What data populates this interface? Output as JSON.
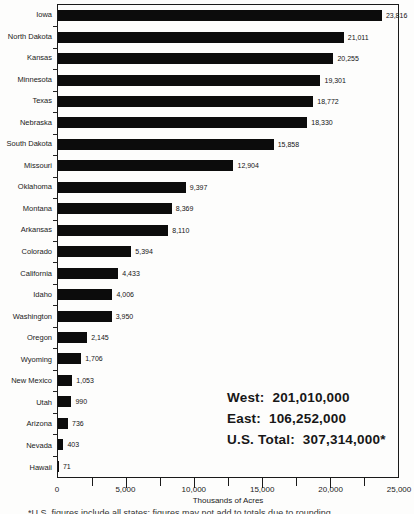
{
  "chart_data": {
    "type": "bar",
    "orientation": "horizontal",
    "categories": [
      "Iowa",
      "North Dakota",
      "Kansas",
      "Minnesota",
      "Texas",
      "Nebraska",
      "South Dakota",
      "Missouri",
      "Oklahoma",
      "Montana",
      "Arkansas",
      "Colorado",
      "California",
      "Idaho",
      "Washington",
      "Oregon",
      "Wyoming",
      "New Mexico",
      "Utah",
      "Arizona",
      "Nevada",
      "Hawaii"
    ],
    "values": [
      23816,
      21011,
      20255,
      19301,
      18772,
      18330,
      15858,
      12904,
      9397,
      8369,
      8110,
      5394,
      4433,
      4006,
      3950,
      2145,
      1706,
      1053,
      990,
      736,
      403,
      71
    ],
    "value_labels": [
      "23,816",
      "21,011",
      "20,255",
      "19,301",
      "18,772",
      "18,330",
      "15,858",
      "12,904",
      "9,397",
      "8,369",
      "8,110",
      "5,394",
      "4,433",
      "4,006",
      "3,950",
      "2,145",
      "1,706",
      "1,053",
      "990",
      "736",
      "403",
      "71"
    ],
    "xlabel": "Thousands of Acres",
    "xlim": [
      0,
      25000
    ],
    "x_ticks": [
      0,
      5000,
      10000,
      15000,
      20000,
      25000
    ],
    "x_tick_labels": [
      "0",
      "5,000",
      "10,000",
      "15,000",
      "20,000",
      "25,000"
    ],
    "minor_tick_interval": 2500,
    "grid": false,
    "legend": "none",
    "bar_color": "#0c0c0c",
    "plot_border_color": "#1a1a1a"
  },
  "annotation": {
    "lines": [
      {
        "label": "West:",
        "value": "201,010,000"
      },
      {
        "label": "East:",
        "value": "106,252,000"
      },
      {
        "label": "U.S. Total:",
        "value": "307,314,000*"
      }
    ]
  },
  "footnote": {
    "clipped": true,
    "text": "*U.S. figures include all states; figures may not add to totals due to rounding."
  }
}
